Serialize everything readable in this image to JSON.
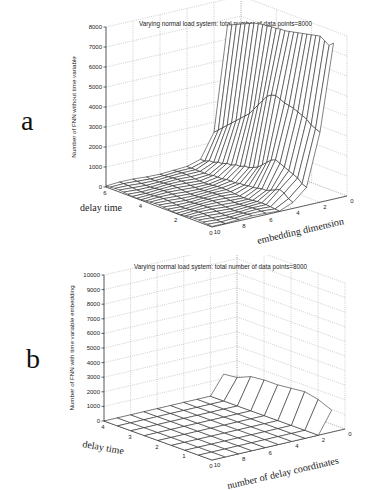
{
  "chart_data": [
    {
      "id": "a",
      "type": "surface3d",
      "panel_letter": "a",
      "title": "Varying normal load system: total number of data points=8000",
      "xlabel": "embedding dimension",
      "ylabel": "delay time",
      "zlabel": "Number of FNN without time variable",
      "x_ticks": [
        "0",
        "2",
        "4",
        "6",
        "8",
        "10"
      ],
      "y_ticks": [
        "0",
        "2",
        "4",
        "6"
      ],
      "z_ticks": [
        "0",
        "1000",
        "2000",
        "3000",
        "4000",
        "5000",
        "6000",
        "7000",
        "8000"
      ],
      "xlim": [
        0,
        10
      ],
      "ylim": [
        0,
        6
      ],
      "zlim": [
        0,
        8000
      ],
      "grid": true,
      "x": [
        1,
        2,
        3,
        4,
        5,
        6,
        7,
        8,
        9,
        10
      ],
      "y": [
        0,
        0.25,
        0.5,
        0.75,
        1,
        1.25,
        1.5,
        1.75,
        2,
        2.25,
        2.5,
        2.75,
        3,
        3.25,
        3.5,
        3.75,
        4,
        4.25,
        4.5,
        4.75,
        5,
        5.25,
        5.5,
        5.75,
        6
      ],
      "z_description": "FNN count vs embedding dimension (rows) and delay time (columns). Dimension 1 ~7600-8000 across delays; dimension 2 ~3400-4500; drops toward ~0-800 for dimension >= 4.",
      "z_row_dim1": [
        7800,
        7600,
        7750,
        7900,
        7850,
        7800,
        7750,
        7700,
        7650,
        7600,
        7550,
        7500,
        7500,
        7450,
        7450,
        7400,
        7400,
        7350,
        7300,
        7200,
        7100,
        7000,
        6900,
        6800,
        6700
      ],
      "z_row_dim2": [
        3500,
        3600,
        3700,
        3900,
        4000,
        4100,
        4200,
        4250,
        4300,
        4400,
        4500,
        4450,
        4300,
        4000,
        3700,
        3400,
        3100,
        2900,
        2700,
        2500,
        2300,
        2100,
        1900,
        1700,
        1500
      ],
      "z_row_dim3": [
        900,
        1000,
        1200,
        1300,
        1400,
        1500,
        1600,
        1700,
        1600,
        1400,
        1200,
        1000,
        900,
        800,
        800,
        700,
        700,
        600,
        600,
        500,
        500,
        400,
        400,
        300,
        300
      ],
      "z_row_dim4": [
        300,
        400,
        600,
        700,
        600,
        500,
        400,
        400,
        350,
        300,
        300,
        250,
        250,
        200,
        200,
        200,
        150,
        150,
        150,
        100,
        100,
        100,
        100,
        100,
        100
      ],
      "z_row_dim5plus": 100
    },
    {
      "id": "b",
      "type": "surface3d",
      "panel_letter": "b",
      "title": "Varying normal load system: total number of data points=8000",
      "xlabel": "number of delay coordinates",
      "ylabel": "delay time",
      "zlabel": "Number of FNN with time variable embedding",
      "x_ticks": [
        "0",
        "2",
        "4",
        "6",
        "8",
        "10"
      ],
      "y_ticks": [
        "0",
        "1",
        "2",
        "3",
        "4"
      ],
      "z_ticks": [
        "0",
        "1000",
        "2000",
        "3000",
        "4000",
        "5000",
        "6000",
        "7000",
        "8000",
        "9000",
        "10000"
      ],
      "xlim": [
        0,
        10
      ],
      "ylim": [
        0,
        4
      ],
      "zlim": [
        0,
        10000
      ],
      "grid": true,
      "x": [
        1,
        2,
        3,
        4,
        5,
        6,
        7,
        8,
        9,
        10
      ],
      "y": [
        0,
        0.5,
        1,
        1.5,
        2,
        2.5,
        3,
        3.5,
        4
      ],
      "z_row_dim1": [
        1500,
        1900,
        2100,
        2000,
        1900,
        1900,
        1800,
        1400,
        1300
      ],
      "z_row_dim2plus": 0,
      "z_description": "Only 1 delay coordinate yields ~1300-2100 FNN; all higher counts are ~0."
    }
  ],
  "figure": {
    "panel_a_letter": "a",
    "panel_b_letter": "b"
  }
}
